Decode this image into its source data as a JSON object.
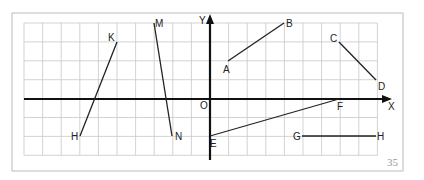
{
  "diagram": {
    "page_number": "35",
    "axes": {
      "x_label": "X",
      "y_label": "Y",
      "origin_label": "O"
    },
    "grid": {
      "cols": 19,
      "rows": 7,
      "x0": 24,
      "y0": 23,
      "cell_w": 18.6,
      "cell_h": 18.9,
      "y_axis_col": 10,
      "x_axis_row": 4
    },
    "segments": [
      {
        "name": "AB",
        "from": {
          "label": "A",
          "x": 228,
          "y": 61
        },
        "to": {
          "label": "B",
          "x": 284,
          "y": 23
        }
      },
      {
        "name": "CD",
        "from": {
          "label": "C",
          "x": 339,
          "y": 42
        },
        "to": {
          "label": "D",
          "x": 376,
          "y": 80
        }
      },
      {
        "name": "EF",
        "from": {
          "label": "E",
          "x": 210,
          "y": 136
        },
        "to": {
          "label": "F",
          "x": 339,
          "y": 99
        }
      },
      {
        "name": "GH",
        "from": {
          "label": "G",
          "x": 302,
          "y": 136
        },
        "to": {
          "label": "H",
          "x": 376,
          "y": 136
        }
      },
      {
        "name": "HK",
        "from": {
          "label": "H",
          "x": 80,
          "y": 136
        },
        "to": {
          "label": "K",
          "x": 117,
          "y": 42
        }
      },
      {
        "name": "MN",
        "from": {
          "label": "M",
          "x": 154,
          "y": 23
        },
        "to": {
          "label": "N",
          "x": 172,
          "y": 136
        }
      }
    ],
    "colors": {
      "grid": "#c8c8c8",
      "axis": "#111111",
      "segment": "#222222",
      "border": "#bbbbbb"
    }
  }
}
